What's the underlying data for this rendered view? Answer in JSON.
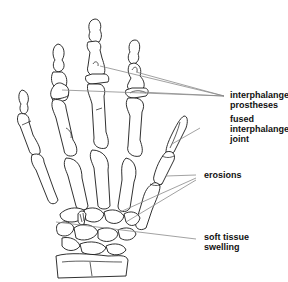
{
  "diagram": {
    "labels": [
      {
        "id": "prostheses",
        "lines": [
          "interphalangeal",
          "prostheses"
        ]
      },
      {
        "id": "fused",
        "lines": [
          "fused",
          "interphalangeal",
          "joint"
        ]
      },
      {
        "id": "erosions",
        "lines": [
          "erosions"
        ]
      },
      {
        "id": "swelling",
        "lines": [
          "soft tissue",
          "swelling"
        ]
      }
    ],
    "colors": {
      "line_art": "#1a1a1a",
      "leader_lines": "#8a8a8a",
      "label_text": "#111111",
      "background": "#ffffff"
    }
  }
}
